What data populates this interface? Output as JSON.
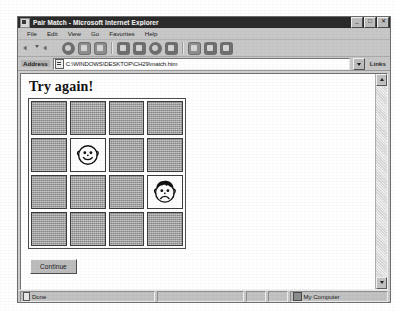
{
  "window": {
    "title": "Pair Match - Microsoft Internet Explorer",
    "icon": "ie-document-icon",
    "controls": [
      {
        "name": "minimize",
        "glyph": "_"
      },
      {
        "name": "maximize",
        "glyph": "□"
      },
      {
        "name": "close",
        "glyph": "✕"
      }
    ]
  },
  "menu": {
    "items": [
      "File",
      "Edit",
      "View",
      "Go",
      "Favorites",
      "Help"
    ]
  },
  "toolbar": {
    "buttons": [
      {
        "name": "back-button",
        "icon": "back-arrow-icon"
      },
      {
        "name": "forward-button",
        "icon": "forward-arrow-icon"
      },
      {
        "name": "stop-button",
        "icon": "stop-icon"
      },
      {
        "name": "refresh-button",
        "icon": "refresh-icon"
      },
      {
        "name": "home-button",
        "icon": "home-icon"
      },
      {
        "name": "search-button",
        "icon": "search-icon"
      },
      {
        "name": "favorites-button",
        "icon": "favorites-folder-icon"
      },
      {
        "name": "history-button",
        "icon": "history-icon"
      },
      {
        "name": "channels-button",
        "icon": "channels-icon"
      },
      {
        "name": "fullscreen-button",
        "icon": "fullscreen-icon"
      },
      {
        "name": "mail-button",
        "icon": "mail-icon"
      },
      {
        "name": "print-button",
        "icon": "print-icon"
      },
      {
        "name": "edit-button",
        "icon": "edit-icon"
      }
    ]
  },
  "address": {
    "label": "Address",
    "value": "C:\\WINDOWS\\DESKTOP\\CH29\\match.htm",
    "placeholder": "Address",
    "links_label": "Links"
  },
  "page": {
    "heading": "Try again!",
    "continue_label": "Continue",
    "grid": {
      "rows": 4,
      "columns": 4,
      "tile_color": "#a2a2a2",
      "revealed_color": "#fdfdfd",
      "tiles": [
        {
          "row": 1,
          "col": 1,
          "state": "hidden",
          "face": null
        },
        {
          "row": 1,
          "col": 2,
          "state": "hidden",
          "face": null
        },
        {
          "row": 1,
          "col": 3,
          "state": "hidden",
          "face": null
        },
        {
          "row": 1,
          "col": 4,
          "state": "hidden",
          "face": null
        },
        {
          "row": 2,
          "col": 1,
          "state": "hidden",
          "face": null
        },
        {
          "row": 2,
          "col": 2,
          "state": "revealed",
          "face": "smiling-face"
        },
        {
          "row": 2,
          "col": 3,
          "state": "hidden",
          "face": null
        },
        {
          "row": 2,
          "col": 4,
          "state": "hidden",
          "face": null
        },
        {
          "row": 3,
          "col": 1,
          "state": "hidden",
          "face": null
        },
        {
          "row": 3,
          "col": 2,
          "state": "hidden",
          "face": null
        },
        {
          "row": 3,
          "col": 3,
          "state": "hidden",
          "face": null
        },
        {
          "row": 3,
          "col": 4,
          "state": "revealed",
          "face": "frowning-face-with-hair"
        },
        {
          "row": 4,
          "col": 1,
          "state": "hidden",
          "face": null
        },
        {
          "row": 4,
          "col": 2,
          "state": "hidden",
          "face": null
        },
        {
          "row": 4,
          "col": 3,
          "state": "hidden",
          "face": null
        },
        {
          "row": 4,
          "col": 4,
          "state": "hidden",
          "face": null
        }
      ]
    }
  },
  "statusbar": {
    "status": "Done",
    "zone": "My Computer",
    "zone_icon": "computer-icon"
  }
}
